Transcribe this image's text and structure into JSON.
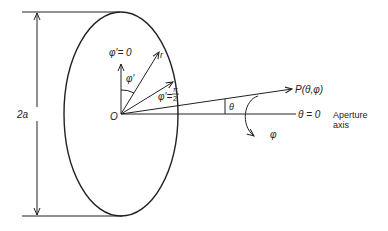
{
  "diagram": {
    "type": "aperture-coordinate-geometry",
    "labels": {
      "dimension": "2a",
      "origin": "O",
      "phi_prime_zero": "φ′= 0",
      "phi_prime": "φ′",
      "r": "r",
      "phi_prime_half_pi": "φ′= π/2",
      "phi_prime_half_pi_lhs": "φ′=",
      "pi": "π",
      "two": "2",
      "point": "P(θ,φ)",
      "theta": "θ",
      "theta_zero": "θ = 0",
      "aperture_axis_line1": "Aperture",
      "aperture_axis_line2": "axis",
      "phi": "φ"
    },
    "colors": {
      "stroke": "#222222",
      "background": "#ffffff"
    }
  }
}
